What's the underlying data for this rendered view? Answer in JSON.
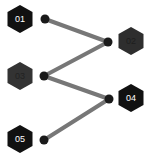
{
  "diagram": {
    "type": "zigzag-process",
    "line_color": "#777777",
    "dot_color": "#1a1a1a",
    "nodes": [
      {
        "label": "01",
        "hex_color": "#111111",
        "text_color": "#ffffff"
      },
      {
        "label": "02",
        "hex_color": "#2e2e2e",
        "text_color": "#1e1e1e"
      },
      {
        "label": "03",
        "hex_color": "#333333",
        "text_color": "#222222"
      },
      {
        "label": "04",
        "hex_color": "#111111",
        "text_color": "#ffffff"
      },
      {
        "label": "05",
        "hex_color": "#111111",
        "text_color": "#ffffff"
      }
    ]
  }
}
